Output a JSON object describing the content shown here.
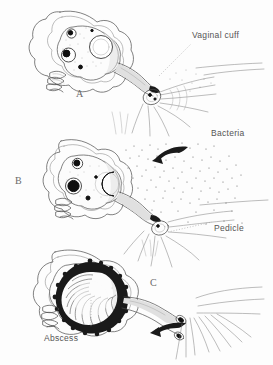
{
  "figure": {
    "type": "medical-line-illustration",
    "title": "",
    "background_color": "#fdfdfd",
    "ink_color": "#4a4a4a",
    "accent_color": "#1a1a1a",
    "panel_count": 3
  },
  "panels": [
    {
      "id": "A",
      "letter": "A",
      "letter_x": 76,
      "letter_y": 88,
      "description": "Adnexa with ovary and fallopian tube adjacent to vaginal cuff"
    },
    {
      "id": "B",
      "letter": "B",
      "letter_x": 15,
      "letter_y": 175,
      "description": "Bacteria migrating from vaginal cuff toward the pedicle"
    },
    {
      "id": "C",
      "letter": "C",
      "letter_x": 150,
      "letter_y": 277,
      "description": "Established tubo-ovarian abscess"
    }
  ],
  "labels": [
    {
      "id": "vaginal-cuff",
      "text": "Vaginal cuff",
      "x": 192,
      "y": 30,
      "leader": true
    },
    {
      "id": "bacteria",
      "text": "Bacteria",
      "x": 211,
      "y": 128,
      "leader": false
    },
    {
      "id": "pedicle",
      "text": "Pedicle",
      "x": 214,
      "y": 223,
      "leader": true
    },
    {
      "id": "abscess",
      "text": "Abscess",
      "x": 44,
      "y": 333,
      "leader": true
    }
  ],
  "arrows": [
    {
      "id": "bacteria-arrow",
      "panel": "B",
      "direction": "left",
      "color": "#1a1a1a"
    },
    {
      "id": "pedicle-arrow",
      "panel": "C",
      "direction": "left",
      "color": "#1a1a1a"
    }
  ]
}
